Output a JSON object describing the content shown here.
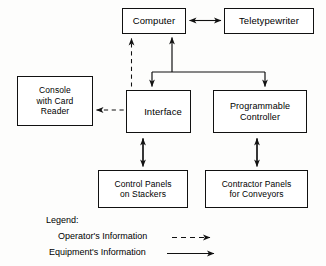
{
  "diagram": {
    "type": "block-diagram",
    "title_visible": false,
    "nodes": [
      {
        "id": "computer",
        "label": "Computer",
        "x": 122,
        "y": 8,
        "w": 64,
        "h": 26,
        "font_size": 9.5
      },
      {
        "id": "teletypewriter",
        "label": "Teletypewriter",
        "x": 224,
        "y": 8,
        "w": 90,
        "h": 26,
        "font_size": 9.5
      },
      {
        "id": "console-card-reader",
        "label": "Console\nwith Card\nReader",
        "x": 17,
        "y": 76,
        "w": 76,
        "h": 50,
        "font_size": 8.5
      },
      {
        "id": "interface",
        "label": "Interface",
        "x": 126,
        "y": 90,
        "w": 65,
        "h": 43,
        "font_size": 9.5
      },
      {
        "id": "programmable-controller",
        "label": "Programmable\nController",
        "x": 213,
        "y": 90,
        "w": 94,
        "h": 43,
        "font_size": 9
      },
      {
        "id": "control-panels-stackers",
        "label": "Control Panels\non Stackers",
        "x": 98,
        "y": 170,
        "w": 90,
        "h": 38,
        "font_size": 8.5
      },
      {
        "id": "contractor-panels-conveyors",
        "label": "Contractor Panels\nfor Conveyors",
        "x": 205,
        "y": 170,
        "w": 103,
        "h": 38,
        "font_size": 8.5
      }
    ],
    "edges": [
      {
        "id": "computer-to-teletypewriter",
        "from": "computer",
        "to": "teletypewriter",
        "style": "solid",
        "arrow": "both-separate"
      },
      {
        "id": "bus-to-computer",
        "from": "bus",
        "to": "computer",
        "style": "solid",
        "arrow": "up"
      },
      {
        "id": "bus-to-interface",
        "from": "bus",
        "to": "interface",
        "style": "solid",
        "arrow": "down"
      },
      {
        "id": "bus-to-controller",
        "from": "bus",
        "to": "programmable-controller",
        "style": "solid",
        "arrow": "down"
      },
      {
        "id": "interface-to-computer-operator",
        "from": "interface",
        "to": "computer",
        "style": "dashed",
        "arrow": "up"
      },
      {
        "id": "interface-to-console-operator",
        "from": "interface",
        "to": "console-card-reader",
        "style": "dashed",
        "arrow": "left"
      },
      {
        "id": "interface-to-control-panels",
        "from": "interface",
        "to": "control-panels-stackers",
        "style": "solid",
        "arrow": "both"
      },
      {
        "id": "controller-to-contractor-panels",
        "from": "programmable-controller",
        "to": "contractor-panels-conveyors",
        "style": "solid",
        "arrow": "both"
      }
    ]
  },
  "legend": {
    "title": "Legend:",
    "items": [
      {
        "id": "operators-information",
        "label": "Operator's Information",
        "line_style": "dashed"
      },
      {
        "id": "equipments-information",
        "label": "Equipment's Information",
        "line_style": "solid"
      }
    ]
  },
  "colors": {
    "ink": "#111111",
    "paper": "#fdfdfc"
  }
}
